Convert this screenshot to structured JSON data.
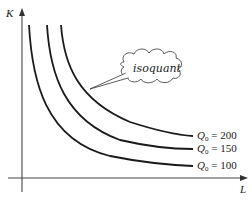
{
  "diagram": {
    "type": "isoquant-map",
    "axes": {
      "y_label": "K",
      "x_label": "L"
    },
    "curves": [
      {
        "id": "q100",
        "label_var": "Q",
        "label_sub": "0",
        "label_rest": " = 100",
        "value": 100
      },
      {
        "id": "q150",
        "label_var": "Q",
        "label_sub": "0",
        "label_rest": " = 150",
        "value": 150
      },
      {
        "id": "q200",
        "label_var": "Q",
        "label_sub": "0",
        "label_rest": " = 200",
        "value": 200
      }
    ],
    "callout": {
      "text": "isoquant"
    },
    "colors": {
      "line": "#1a1a1a",
      "axis": "#333333",
      "background": "#ffffff"
    }
  }
}
